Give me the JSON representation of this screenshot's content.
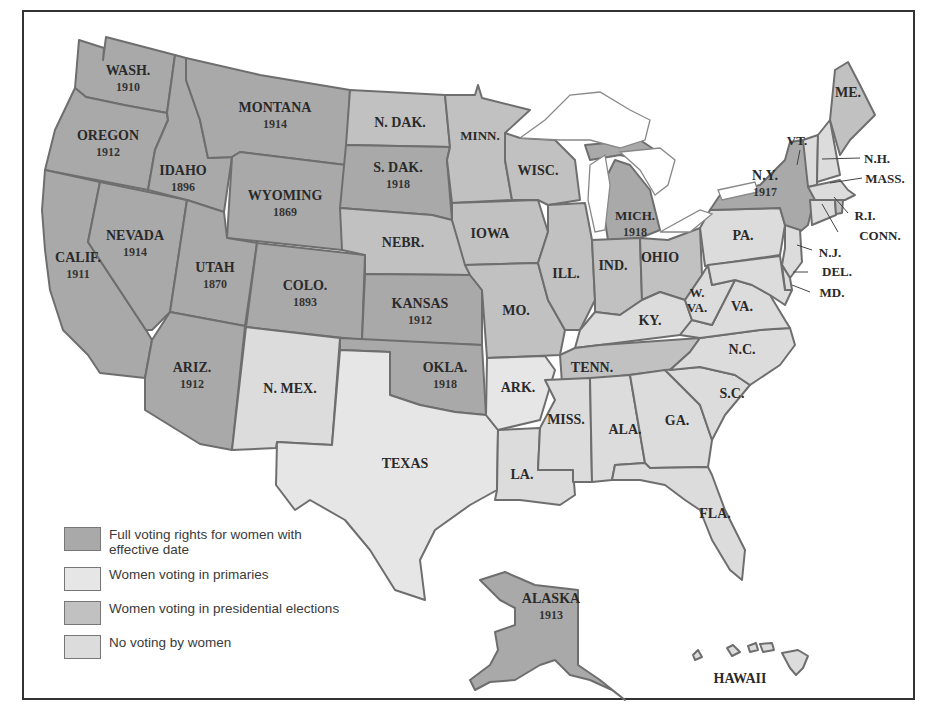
{
  "map": {
    "colors": {
      "full": "#a9a9a9",
      "primaries": "#e6e6e6",
      "presidential": "#c1c1c1",
      "none": "#dcdcdc",
      "border": "#6e6e6e"
    },
    "states": [
      {
        "id": "wa",
        "label": "WASH.",
        "year": "1910",
        "cat": "full"
      },
      {
        "id": "or",
        "label": "OREGON",
        "year": "1912",
        "cat": "full"
      },
      {
        "id": "ca",
        "label": "CALIF.",
        "year": "1911",
        "cat": "full"
      },
      {
        "id": "id",
        "label": "IDAHO",
        "year": "1896",
        "cat": "full"
      },
      {
        "id": "nv",
        "label": "NEVADA",
        "year": "1914",
        "cat": "full"
      },
      {
        "id": "mt",
        "label": "MONTANA",
        "year": "1914",
        "cat": "full"
      },
      {
        "id": "wy",
        "label": "WYOMING",
        "year": "1869",
        "cat": "full"
      },
      {
        "id": "ut",
        "label": "UTAH",
        "year": "1870",
        "cat": "full"
      },
      {
        "id": "co",
        "label": "COLO.",
        "year": "1893",
        "cat": "full"
      },
      {
        "id": "az",
        "label": "ARIZ.",
        "year": "1912",
        "cat": "full"
      },
      {
        "id": "nm",
        "label": "N. MEX.",
        "year": "",
        "cat": "none"
      },
      {
        "id": "nd",
        "label": "N. DAK.",
        "year": "",
        "cat": "presidential"
      },
      {
        "id": "sd",
        "label": "S. DAK.",
        "year": "1918",
        "cat": "full"
      },
      {
        "id": "ne",
        "label": "NEBR.",
        "year": "",
        "cat": "presidential"
      },
      {
        "id": "ks",
        "label": "KANSAS",
        "year": "1912",
        "cat": "full"
      },
      {
        "id": "ok",
        "label": "OKLA.",
        "year": "1918",
        "cat": "full"
      },
      {
        "id": "tx",
        "label": "TEXAS",
        "year": "",
        "cat": "primaries"
      },
      {
        "id": "mn",
        "label": "MINN.",
        "year": "",
        "cat": "presidential"
      },
      {
        "id": "ia",
        "label": "IOWA",
        "year": "",
        "cat": "presidential"
      },
      {
        "id": "mo",
        "label": "MO.",
        "year": "",
        "cat": "presidential"
      },
      {
        "id": "ar",
        "label": "ARK.",
        "year": "",
        "cat": "primaries"
      },
      {
        "id": "la",
        "label": "LA.",
        "year": "",
        "cat": "none"
      },
      {
        "id": "wi",
        "label": "WISC.",
        "year": "",
        "cat": "presidential"
      },
      {
        "id": "il",
        "label": "ILL.",
        "year": "",
        "cat": "presidential"
      },
      {
        "id": "mi",
        "label": "MICH.",
        "year": "1918",
        "cat": "full"
      },
      {
        "id": "in",
        "label": "IND.",
        "year": "",
        "cat": "presidential"
      },
      {
        "id": "oh",
        "label": "OHIO",
        "year": "",
        "cat": "presidential"
      },
      {
        "id": "ky",
        "label": "KY.",
        "year": "",
        "cat": "none"
      },
      {
        "id": "tn",
        "label": "TENN.",
        "year": "",
        "cat": "presidential"
      },
      {
        "id": "ms",
        "label": "MISS.",
        "year": "",
        "cat": "none"
      },
      {
        "id": "al",
        "label": "ALA.",
        "year": "",
        "cat": "none"
      },
      {
        "id": "ga",
        "label": "GA.",
        "year": "",
        "cat": "none"
      },
      {
        "id": "fl",
        "label": "FLA.",
        "year": "",
        "cat": "none"
      },
      {
        "id": "sc",
        "label": "S.C.",
        "year": "",
        "cat": "none"
      },
      {
        "id": "nc",
        "label": "N.C.",
        "year": "",
        "cat": "none"
      },
      {
        "id": "va",
        "label": "VA.",
        "year": "",
        "cat": "none"
      },
      {
        "id": "wv",
        "label": "W. VA.",
        "year": "",
        "cat": "none"
      },
      {
        "id": "pa",
        "label": "PA.",
        "year": "",
        "cat": "none"
      },
      {
        "id": "ny",
        "label": "N.Y.",
        "year": "1917",
        "cat": "full"
      },
      {
        "id": "vt",
        "label": "VT.",
        "year": "",
        "cat": "none"
      },
      {
        "id": "nh",
        "label": "N.H.",
        "year": "",
        "cat": "none"
      },
      {
        "id": "me",
        "label": "ME.",
        "year": "",
        "cat": "presidential"
      },
      {
        "id": "ma",
        "label": "MASS.",
        "year": "",
        "cat": "none"
      },
      {
        "id": "ri",
        "label": "R.I.",
        "year": "",
        "cat": "presidential"
      },
      {
        "id": "ct",
        "label": "CONN.",
        "year": "",
        "cat": "none"
      },
      {
        "id": "nj",
        "label": "N.J.",
        "year": "",
        "cat": "none"
      },
      {
        "id": "de",
        "label": "DEL.",
        "year": "",
        "cat": "none"
      },
      {
        "id": "md",
        "label": "MD.",
        "year": "",
        "cat": "none"
      },
      {
        "id": "ak",
        "label": "ALASKA",
        "year": "1913",
        "cat": "full"
      },
      {
        "id": "hi",
        "label": "HAWAII",
        "year": "",
        "cat": "none"
      }
    ]
  },
  "legend": {
    "items": [
      {
        "label": "Full voting rights for women with effective date",
        "color": "#a9a9a9"
      },
      {
        "label": "Women voting in primaries",
        "color": "#e6e6e6"
      },
      {
        "label": "Women voting in presidential elections",
        "color": "#c1c1c1"
      },
      {
        "label": "No voting by women",
        "color": "#dcdcdc"
      }
    ]
  }
}
